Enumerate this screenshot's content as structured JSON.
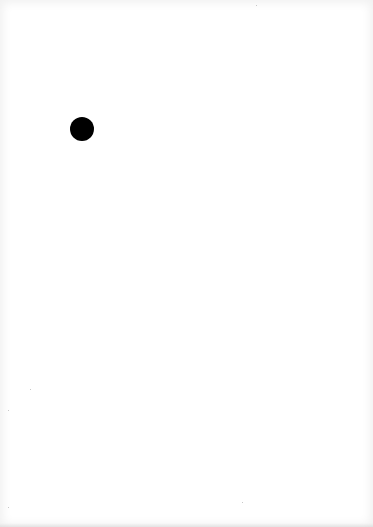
{
  "page": {
    "background": "#ffffff",
    "marks": [
      {
        "type": "filled-circle",
        "cx": 82,
        "cy": 129,
        "r": 12,
        "color": "#000000"
      }
    ],
    "specks": [
      {
        "x": 256,
        "y": 5
      },
      {
        "x": 30,
        "y": 389
      },
      {
        "x": 8,
        "y": 410
      },
      {
        "x": 8,
        "y": 507
      },
      {
        "x": 242,
        "y": 502
      }
    ]
  }
}
